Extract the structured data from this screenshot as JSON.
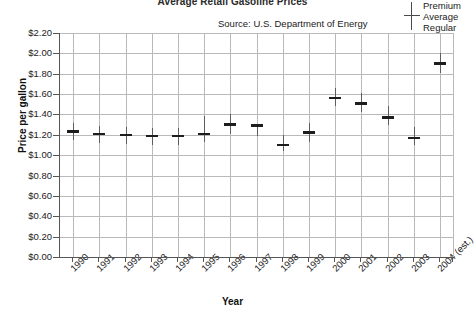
{
  "chart": {
    "title": "Average Retail Gasoline Prices",
    "source_note": "Source: U.S. Department of Energy",
    "xlabel": "Year",
    "ylabel": "Price per gallon"
  },
  "legend": {
    "marker_name": "price-range-marker",
    "entries": [
      "Premium",
      "Average",
      "Regular"
    ],
    "text_block": "Premium\nAverage\nRegular"
  },
  "chart_data": {
    "type": "line",
    "title": "Average Retail Gasoline Prices",
    "subtitle": "Source: U.S. Department of Energy",
    "xlabel": "Year",
    "ylabel": "Price per gallon",
    "ylim": [
      0.0,
      2.2
    ],
    "ytick_step": 0.2,
    "grid": true,
    "legend_position": "top-right",
    "marker_style": "vertical range bar (Regular to Premium) with horizontal tick at Average",
    "categories": [
      "1990",
      "1991",
      "1992",
      "1993",
      "1994",
      "1995",
      "1996",
      "1997",
      "1998",
      "1999",
      "2000",
      "2001",
      "2002",
      "2003",
      "2004 (est.)"
    ],
    "ytick_labels": [
      "$2.20",
      "$2.00",
      "$1.80",
      "$1.60",
      "$1.40",
      "$1.20",
      "$1.00",
      "$0.80",
      "$0.60",
      "$0.40",
      "$0.20",
      "$0.00"
    ],
    "ytick_values": [
      2.2,
      2.0,
      1.8,
      1.6,
      1.4,
      1.2,
      1.0,
      0.8,
      0.6,
      0.4,
      0.2,
      0.0
    ],
    "series": [
      {
        "name": "Premium",
        "values": [
          1.32,
          1.29,
          1.28,
          1.27,
          1.27,
          1.38,
          1.4,
          1.28,
          1.2,
          1.32,
          1.66,
          1.61,
          1.48,
          1.28,
          2.0
        ]
      },
      {
        "name": "Average",
        "values": [
          1.23,
          1.21,
          1.2,
          1.19,
          1.19,
          1.21,
          1.3,
          1.29,
          1.1,
          1.22,
          1.56,
          1.51,
          1.37,
          1.17,
          1.9
        ]
      },
      {
        "name": "Regular",
        "values": [
          1.15,
          1.12,
          1.11,
          1.1,
          1.1,
          1.13,
          1.21,
          1.19,
          1.04,
          1.13,
          1.48,
          1.42,
          1.3,
          1.1,
          1.81
        ]
      }
    ]
  }
}
